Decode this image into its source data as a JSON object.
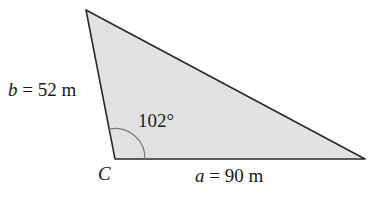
{
  "diagram": {
    "type": "triangle",
    "fill_color": "#e2e2e2",
    "stroke_color": "#2a2a2a",
    "angle_arc_color": "#7a7a7a",
    "vertices": {
      "top": [
        86,
        10
      ],
      "C": [
        115,
        159
      ],
      "right": [
        365,
        159
      ]
    },
    "labels": {
      "side_b_var": "b",
      "side_b_value": " = 52 m",
      "side_a_var": "a",
      "side_a_value": " = 90 m",
      "vertex_c": "C",
      "angle_c": "102°"
    }
  }
}
